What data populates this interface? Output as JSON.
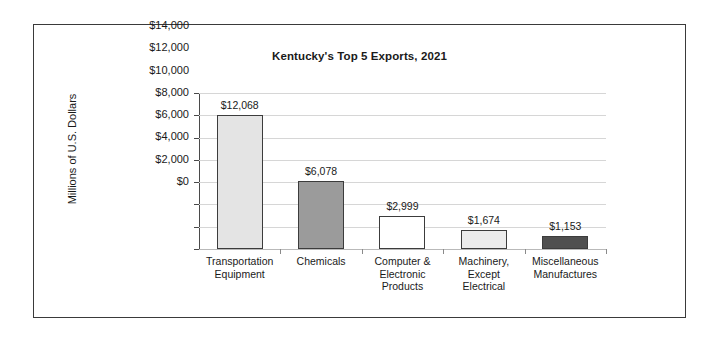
{
  "chart_data": {
    "type": "bar",
    "title": "Kentucky's Top 5 Exports, 2021",
    "xlabel": "",
    "ylabel": "Millions of U.S. Dollars",
    "ylim": [
      0,
      14000
    ],
    "ytick_step": 2000,
    "ytick_labels": [
      "$14,000",
      "$12,000",
      "$10,000",
      "$8,000",
      "$6,000",
      "$4,000",
      "$2,000",
      "$0"
    ],
    "ytick_values": [
      14000,
      12000,
      10000,
      8000,
      6000,
      4000,
      2000,
      0
    ],
    "grid": true,
    "legend": false,
    "categories": [
      "Transportation Equipment",
      "Chemicals",
      "Computer & Electronic Products",
      "Machinery, Except Electrical",
      "Miscellaneous Manufactures"
    ],
    "category_lines": [
      [
        "Transportation",
        "Equipment"
      ],
      [
        "Chemicals"
      ],
      [
        "Computer &",
        "Electronic",
        "Products"
      ],
      [
        "Machinery,",
        "Except",
        "Electrical"
      ],
      [
        "Miscellaneous",
        "Manufactures"
      ]
    ],
    "values": [
      12068,
      6078,
      2999,
      1674,
      1153
    ],
    "value_labels": [
      "$12,068",
      "$6,078",
      "$2,999",
      "$1,674",
      "$1,153"
    ],
    "bar_colors": [
      "#e4e4e4",
      "#9b9b9b",
      "#ffffff",
      "#ececec",
      "#4f4f4f"
    ],
    "bar_border_color": "#3c3c3c",
    "gridline_color": "#d6d6d6",
    "axis_color": "#4a4a4a",
    "frame_color": "#3a3a3a",
    "background": "#ffffff",
    "text_color": "#1a1a1a"
  }
}
